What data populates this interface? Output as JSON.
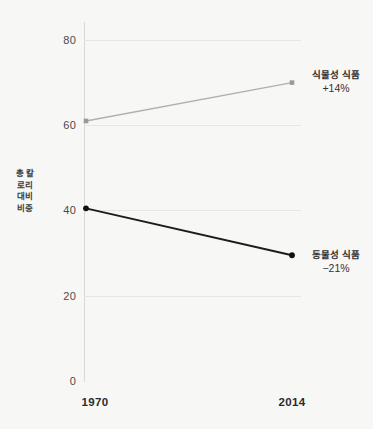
{
  "chart_data": {
    "type": "line",
    "title": "",
    "subtitle": "",
    "xlabel": "",
    "ylabel": "총 칼로리 대비 비중",
    "x": [
      "1970",
      "2014"
    ],
    "categories": [
      "1970",
      "2014"
    ],
    "xlim": [
      "1970",
      "2014"
    ],
    "ylim": [
      0,
      80
    ],
    "yticks": [
      0,
      20,
      40,
      60,
      80
    ],
    "ytick_labels": [
      "0",
      "20",
      "40",
      "60",
      "80"
    ],
    "xtick_labels": [
      "1970",
      "2014"
    ],
    "grid": "horizontal",
    "legend": "inline-endpoint-labels",
    "series": [
      {
        "name": "식물성 식품",
        "values": [
          61,
          70
        ],
        "color": "#b0b0b0",
        "marker_color": "#9a9a9a",
        "annotation": "+14%",
        "annotation_label": "식물성 식품"
      },
      {
        "name": "동물성 식품",
        "values": [
          40.5,
          29.5
        ],
        "color": "#1c1c1c",
        "marker_color": "#111111",
        "annotation": "-21%",
        "annotation_label": "동물성 식품"
      }
    ],
    "annotations": [
      {
        "text": "식물성 식품",
        "value": "+14%"
      },
      {
        "text": "동물성 식품",
        "value": "−21%"
      }
    ]
  },
  "axis": {
    "y_title": "총 칼로리 대비 비중",
    "y_ticks": [
      {
        "label": "80",
        "value": 80
      },
      {
        "label": "60",
        "value": 60
      },
      {
        "label": "40",
        "value": 40
      },
      {
        "label": "20",
        "value": 20
      },
      {
        "label": "0",
        "value": 0
      }
    ],
    "x_ticks": [
      {
        "label": "1970"
      },
      {
        "label": "2014"
      }
    ]
  },
  "annotations": {
    "plant": {
      "name": "식물성 식품",
      "delta": "+14%"
    },
    "animal": {
      "name": "동물성 식품",
      "delta": "−21%"
    }
  },
  "colors": {
    "plant_line": "#b3b3b3",
    "animal_line": "#1a1a1a",
    "grid": "#e6e6e6",
    "axis": "#d8d8d8",
    "background": "#f7f7f6",
    "text": "#2e2e2e"
  }
}
